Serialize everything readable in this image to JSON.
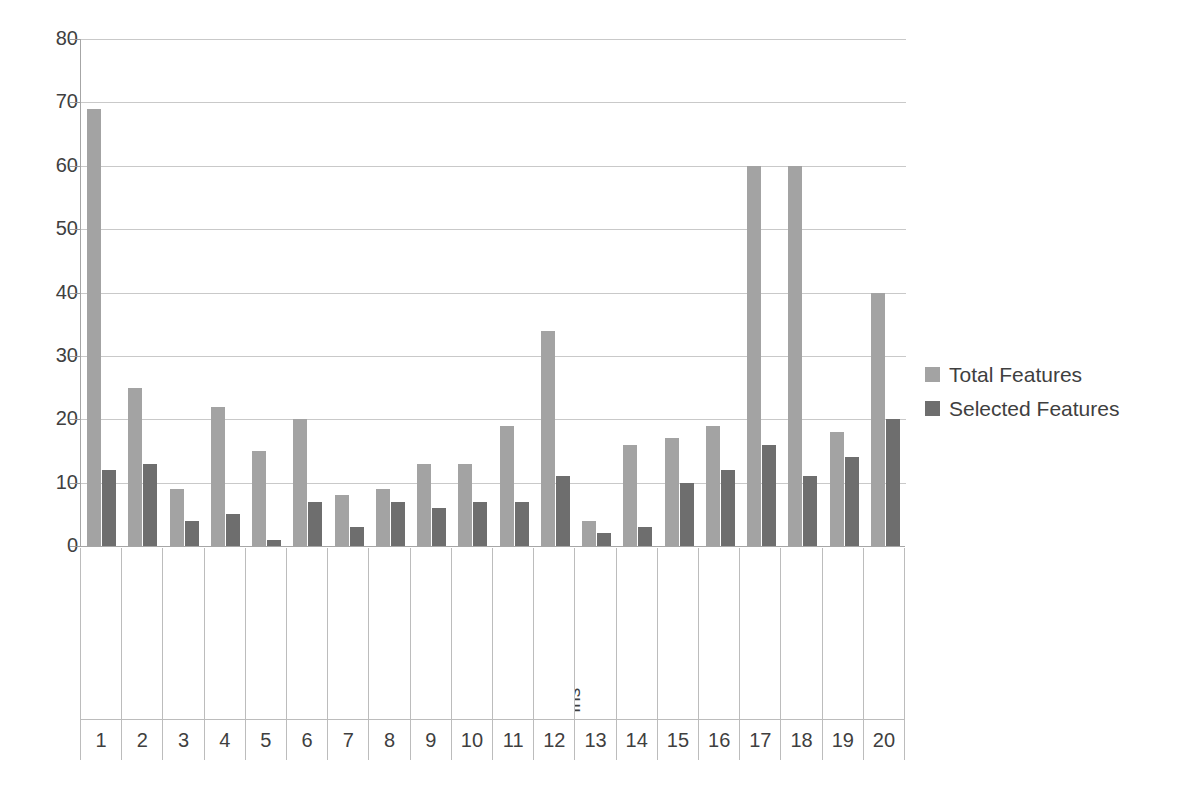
{
  "chart_data": {
    "type": "bar",
    "title": "",
    "xlabel": "",
    "ylabel": "",
    "ylim": [
      0,
      80
    ],
    "yticks": [
      0,
      10,
      20,
      30,
      40,
      50,
      60,
      70,
      80
    ],
    "grid": true,
    "legend_position": "right",
    "index": [
      "1",
      "2",
      "3",
      "4",
      "5",
      "6",
      "7",
      "8",
      "9",
      "10",
      "11",
      "12",
      "13",
      "14",
      "15",
      "16",
      "17",
      "18",
      "19",
      "20"
    ],
    "categories": [
      "Audiology",
      "Autos",
      "Breast Cancer",
      "Colic",
      "Credit -A",
      "Credit Germany",
      "Diabetes",
      "Glass",
      "Heart –C",
      "Heart Statlog",
      "Hepatitis",
      "Ionosphere",
      "Iris",
      "Labor",
      "Primary Tumor",
      "Segment",
      "Sonar",
      "Splice",
      "Vehicle",
      "Waveform"
    ],
    "series": [
      {
        "name": "Total Features",
        "color": "#a3a3a3",
        "values": [
          69,
          25,
          9,
          22,
          15,
          20,
          8,
          9,
          13,
          13,
          19,
          34,
          4,
          16,
          17,
          19,
          60,
          60,
          18,
          40
        ]
      },
      {
        "name": "Selected Features",
        "color": "#6e6e6e",
        "values": [
          12,
          13,
          4,
          5,
          1,
          7,
          3,
          7,
          6,
          7,
          7,
          11,
          2,
          3,
          10,
          12,
          16,
          11,
          14,
          20
        ]
      }
    ]
  },
  "legend": {
    "items": [
      {
        "label": "Total Features",
        "swatch": "legend-swatch-total"
      },
      {
        "label": "Selected Features",
        "swatch": "legend-swatch-selected"
      }
    ]
  }
}
